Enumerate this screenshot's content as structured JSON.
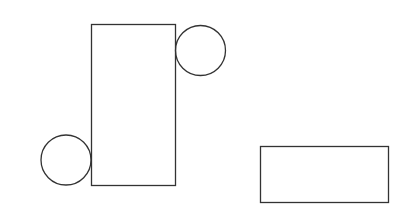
{
  "diagram": {
    "background": "#ffffff",
    "stroke_color": "#333333",
    "fill_color": "none",
    "shapes": [
      {
        "id": "tall-rectangle",
        "type": "rectangle"
      },
      {
        "id": "top-right-circle",
        "type": "circle"
      },
      {
        "id": "bottom-left-circle",
        "type": "circle"
      },
      {
        "id": "wide-rectangle",
        "type": "rectangle"
      }
    ]
  }
}
